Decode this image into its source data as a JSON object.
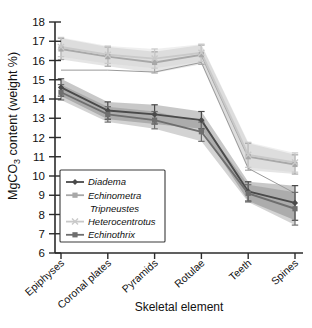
{
  "chart_data": {
    "type": "line",
    "title": "",
    "xlabel": "Skeletal element",
    "ylabel": "MgCO3 content (weight %)",
    "ylabel_parts": {
      "pre": "MgCO",
      "sub": "3",
      "post": " content (weight %)"
    },
    "categories": [
      "Epiphyses",
      "Coronal plates",
      "Pyramids",
      "Rotulae",
      "Teeth",
      "Spines"
    ],
    "ylim": [
      6,
      18
    ],
    "yticks": [
      6,
      7,
      8,
      9,
      10,
      11,
      12,
      13,
      14,
      15,
      16,
      17,
      18
    ],
    "grid": false,
    "legend_position": "lower-left-inside",
    "error_bars": "standard deviation shown as vertical caps; shaded bands show spread",
    "series": [
      {
        "name": "Diadema",
        "marker": "diamond",
        "color": "#4a4a4a",
        "values": [
          14.6,
          13.4,
          13.2,
          12.9,
          9.2,
          8.6
        ],
        "errors": [
          0.45,
          0.45,
          0.5,
          0.45,
          0.5,
          0.9
        ]
      },
      {
        "name": "Echinometra",
        "marker": "square",
        "color": "#a8a8a8",
        "values": [
          16.6,
          16.2,
          15.9,
          16.3,
          11.0,
          10.6
        ],
        "errors": [
          0.55,
          0.5,
          0.55,
          0.5,
          0.7,
          0.5
        ]
      },
      {
        "name": "Tripneustes",
        "marker": "none",
        "color": "#9a9a9a",
        "values": [
          15.5,
          15.5,
          15.4,
          15.9,
          10.4,
          9.1
        ]
      },
      {
        "name": "Heterocentrotus",
        "marker": "cross",
        "color": "#c9c9c9",
        "values": [
          16.7,
          16.3,
          16.1,
          16.4,
          11.1,
          10.7
        ],
        "errors": [
          0.5,
          0.45,
          0.5,
          0.45,
          0.65,
          0.5
        ]
      },
      {
        "name": "Echinothrix",
        "marker": "square",
        "color": "#6e6e6e",
        "values": [
          14.35,
          13.2,
          12.9,
          12.3,
          9.1,
          8.3
        ],
        "errors": [
          0.4,
          0.4,
          0.45,
          0.5,
          0.45,
          0.85
        ]
      }
    ]
  },
  "legend": {
    "items": [
      {
        "label": "Diadema",
        "color": "#4a4a4a",
        "marker": "diamond"
      },
      {
        "label": "Echinometra",
        "color": "#a8a8a8",
        "marker": "square"
      },
      {
        "label": "Tripneustes",
        "color": "#9a9a9a",
        "marker": "none"
      },
      {
        "label": "Heterocentrotus",
        "color": "#c9c9c9",
        "marker": "cross"
      },
      {
        "label": "Echinothrix",
        "color": "#6e6e6e",
        "marker": "square"
      }
    ]
  }
}
